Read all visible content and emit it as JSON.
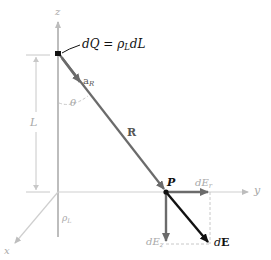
{
  "figure": {
    "colors": {
      "axis": "#bdbdbd",
      "vector_gray": "#6b6b6b",
      "vector_black": "#111111",
      "dashed": "#c8c8c8",
      "label_gray": "#a8a8a8"
    },
    "axes": {
      "z_label": "z",
      "y_label": "y",
      "x_label": "x"
    },
    "labels": {
      "charge_element": "dQ = ρ",
      "charge_element_sub": "L",
      "charge_element_tail": "dL",
      "unit_vector": "a",
      "unit_vector_sub": "R",
      "angle": "θ",
      "length": "L",
      "distance_vector": "R",
      "point": "P",
      "field_radial": "dE",
      "field_radial_sub": "r",
      "field_axial": "dE",
      "field_axial_sub": "z",
      "field_total_d": "d",
      "field_total_E": "E",
      "line_density": "ρ",
      "line_density_sub": "L"
    }
  }
}
